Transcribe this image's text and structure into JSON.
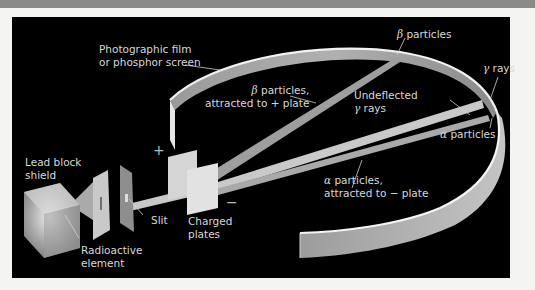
{
  "figure": {
    "type": "Deflection of radioactive emissions by charged plates",
    "colors": {
      "background": "#000000",
      "frame": "#f4f4f2",
      "beam": "#b5b5b5",
      "screen": "#a8a8a8",
      "screen_edge": "#f0f0f0",
      "label_text": "#d8d8d8"
    },
    "labels": {
      "film_line1": "Photographic film",
      "film_line2": "or phosphor screen",
      "beta_top_symbol": "β",
      "beta_top_text": " particles",
      "beta_attr_symbol": "β",
      "beta_attr_text": " particles,",
      "beta_attr_line2": "attracted to + plate",
      "gamma_symbol": "γ",
      "gamma_text": " rays",
      "undeflected_line1": "Undeflected",
      "undeflected_gamma_symbol": "γ",
      "undeflected_gamma_text": " rays",
      "alpha_symbol": "α",
      "alpha_text": " particles",
      "alpha_attr_symbol": "α",
      "alpha_attr_text": " particles,",
      "alpha_attr_line2": "attracted to − plate",
      "lead_line1": "Lead block",
      "lead_line2": "shield",
      "radioactive_line1": "Radioactive",
      "radioactive_line2": "element",
      "slit": "Slit",
      "charged_line1": "Charged",
      "charged_line2": "plates",
      "plus_sign": "+",
      "minus_sign": "−"
    }
  }
}
